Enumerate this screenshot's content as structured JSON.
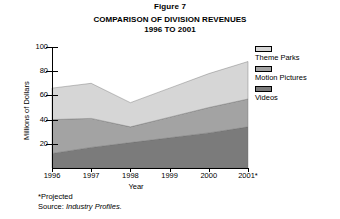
{
  "figure": {
    "caption": "Figure 7",
    "title_line1": "COMPARISON OF DIVISION REVENUES",
    "title_line2": "1996 TO 2001"
  },
  "axes": {
    "y_title": "Millions of Dollars",
    "x_title": "Year",
    "y_ticks": [
      "20",
      "40",
      "60",
      "80",
      "100"
    ],
    "x_ticks": [
      "1996",
      "1997",
      "1998",
      "1999",
      "2000",
      "2001*"
    ]
  },
  "legend": {
    "items": [
      {
        "label": "Theme Parks",
        "color": "#d6d6d6"
      },
      {
        "label": "Motion Pictures",
        "color": "#a3a3a3"
      },
      {
        "label": "Videos",
        "color": "#7b7b7b"
      }
    ]
  },
  "footnotes": {
    "projected": "*Projected",
    "source_prefix": "Source: ",
    "source_name": "Industry Profiles."
  },
  "chart_data": {
    "type": "area",
    "title": "COMPARISON OF DIVISION REVENUES 1996 TO 2001",
    "subtitle": "Figure 7",
    "xlabel": "Year",
    "ylabel": "Millions of Dollars",
    "categories": [
      "1996",
      "1997",
      "1998",
      "1999",
      "2000",
      "2001*"
    ],
    "stacked": true,
    "ylim": [
      0,
      100
    ],
    "xlim": [
      "1996",
      "2001*"
    ],
    "grid": false,
    "legend_position": "right",
    "series": [
      {
        "name": "Videos",
        "color": "#7b7b7b",
        "values": [
          12,
          17,
          21,
          25,
          29,
          34
        ]
      },
      {
        "name": "Motion Pictures",
        "color": "#a3a3a3",
        "values": [
          28,
          24,
          13,
          17,
          21,
          23
        ]
      },
      {
        "name": "Theme Parks",
        "color": "#d6d6d6",
        "values": [
          26,
          29,
          20,
          24,
          28,
          31
        ]
      }
    ],
    "cumulative_totals": [
      66,
      70,
      54,
      66,
      78,
      88
    ],
    "annotations": [
      "*Projected",
      "Source: Industry Profiles."
    ]
  }
}
